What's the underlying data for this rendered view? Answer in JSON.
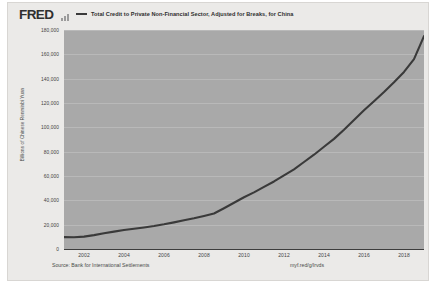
{
  "header": {
    "logo_text": "FRED",
    "spark_icon": "sparkline-icon",
    "legend": {
      "swatch_color": "#3a3a3a",
      "label": "Total Credit to Private Non-Financial Sector, Adjusted for Breaks, for China"
    }
  },
  "footer": {
    "source": "Source: Bank for International Settlements",
    "shorturl": "myf.red/g/lrvds"
  },
  "chart_data": {
    "type": "line",
    "title": "Total Credit to Private Non-Financial Sector, Adjusted for Breaks, for China",
    "xlabel": "",
    "ylabel": "Billions of Chinese Renminbi Yuan",
    "xlim": [
      2001.0,
      2019.0
    ],
    "ylim": [
      0,
      180000
    ],
    "grid": true,
    "legend_position": "top",
    "line_color": "#3a3a3a",
    "plot_background": "#a9a9a9",
    "ytick_labels": [
      "180,000",
      "160,000",
      "140,000",
      "120,000",
      "100,000",
      "80,000",
      "60,000",
      "40,000",
      "20,000",
      "0"
    ],
    "ytick_values": [
      180000,
      160000,
      140000,
      120000,
      100000,
      80000,
      60000,
      40000,
      20000,
      0
    ],
    "xtick_labels": [
      "2002",
      "2004",
      "2006",
      "2008",
      "2010",
      "2012",
      "2014",
      "2016",
      "2018"
    ],
    "xtick_values": [
      2002,
      2004,
      2006,
      2008,
      2010,
      2012,
      2014,
      2016,
      2018
    ],
    "series": [
      {
        "name": "Total Credit to Private Non-Financial Sector, Adjusted for Breaks, for China",
        "x": [
          2001.0,
          2001.5,
          2002.0,
          2002.5,
          2003.0,
          2003.5,
          2004.0,
          2004.5,
          2005.0,
          2005.5,
          2006.0,
          2006.5,
          2007.0,
          2007.5,
          2008.0,
          2008.5,
          2009.0,
          2009.5,
          2010.0,
          2010.5,
          2011.0,
          2011.5,
          2012.0,
          2012.5,
          2013.0,
          2013.5,
          2014.0,
          2014.5,
          2015.0,
          2015.5,
          2016.0,
          2016.5,
          2017.0,
          2017.5,
          2018.0,
          2018.5,
          2019.0
        ],
        "y": [
          9800,
          9700,
          10200,
          11400,
          12900,
          14300,
          15600,
          16600,
          17700,
          18900,
          20300,
          21900,
          23600,
          25300,
          27200,
          29200,
          33500,
          38000,
          42500,
          46500,
          51000,
          55500,
          60500,
          65500,
          71500,
          77500,
          84000,
          90500,
          98000,
          106000,
          114000,
          121500,
          129000,
          137000,
          145500,
          156000,
          175000
        ]
      }
    ]
  }
}
